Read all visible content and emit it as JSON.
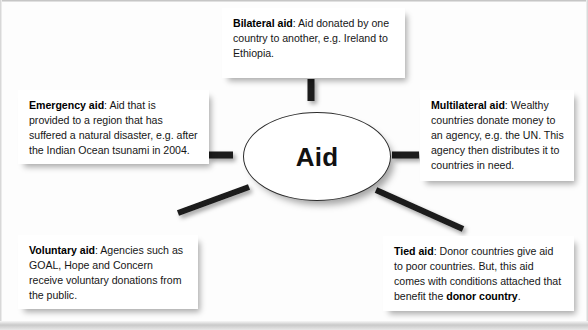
{
  "diagram": {
    "title": "Aid",
    "hub": {
      "label": "Aid",
      "shape": "ellipse"
    },
    "colors": {
      "background": "#fdfdfd",
      "box_fill": "#ffffff",
      "text": "#161616",
      "stroke": "#2b2b2b",
      "connector": "#1a1a1a"
    },
    "nodes": [
      {
        "id": "bilateral",
        "term": "Bilateral aid",
        "separator": ": ",
        "definition": "Aid donated by one country to another, e.g. Ireland to Ethiopia.",
        "position": "top",
        "connector": "vertical"
      },
      {
        "id": "emergency",
        "term": "Emergency aid",
        "separator": ": ",
        "definition": "Aid that is provided to a region that has suffered a natural disaster, e.g. after the Indian Ocean tsunami in 2004.",
        "position": "left",
        "connector": "horizontal"
      },
      {
        "id": "multilateral",
        "term": "Multilateral aid",
        "separator": ": ",
        "definition": "Wealthy countries donate money to an agency, e.g. the UN. This agency then distributes it to countries in need.",
        "position": "right",
        "connector": "horizontal"
      },
      {
        "id": "voluntary",
        "term": "Voluntary aid",
        "separator": ": ",
        "definition": "Agencies such as GOAL, Hope and Concern receive voluntary donations from the public.",
        "position": "bottom-left",
        "connector": "diagonal"
      },
      {
        "id": "tied",
        "term": "Tied aid",
        "separator": ": ",
        "definition_part1": "Donor countries give aid to poor countries. But, this aid comes with conditions attached that benefit the ",
        "emphasis": "donor country",
        "definition_part2": ".",
        "position": "bottom-right",
        "connector": "diagonal"
      }
    ]
  }
}
